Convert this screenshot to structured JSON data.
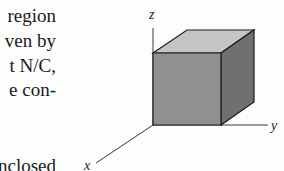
{
  "text_fragment": {
    "lines": [
      "region",
      "ven by",
      "t N/C,",
      "e con-",
      "nclosed"
    ]
  },
  "figure": {
    "type": "cube-in-3d-axes",
    "axis_labels": {
      "x": "x",
      "y": "y",
      "z": "z"
    },
    "colors": {
      "front_face": "#8f8f8f",
      "top_face": "#c4c4c4",
      "side_face": "#6f6f6f",
      "edges": "#1c1c1c",
      "axes": "#3a3a3a"
    }
  }
}
